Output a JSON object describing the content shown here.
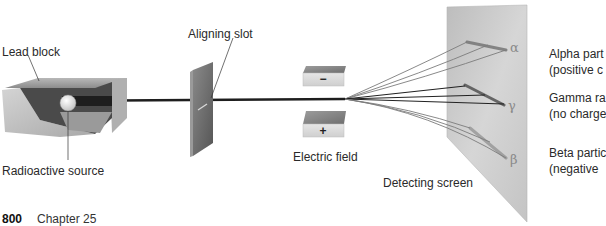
{
  "diagram": {
    "labels": {
      "lead_block": "Lead block",
      "radioactive_source": "Radioactive source",
      "aligning_slot": "Aligning slot",
      "electric_field": "Electric field",
      "detecting_screen": "Detecting screen"
    },
    "plates": {
      "top_sign": "−",
      "bottom_sign": "+"
    },
    "screen_marks": {
      "alpha": "α",
      "gamma": "γ",
      "beta": "β"
    },
    "legend": [
      {
        "name": "Alpha particles",
        "line1": "Alpha part",
        "line2": "(positive c"
      },
      {
        "name": "Gamma rays",
        "line1": "Gamma ra",
        "line2": "(no charge"
      },
      {
        "name": "Beta particles",
        "line1": "Beta partic",
        "line2": "(negative"
      }
    ],
    "colors": {
      "screen": "#c8c8c8",
      "lead_block": "#9a9a9a",
      "slot_plate": "#6e6e6e",
      "beam": "#222222",
      "alpha_beta_beam": "#7a7a7a"
    }
  },
  "footer": {
    "page_number": "800",
    "chapter": "Chapter 25"
  }
}
